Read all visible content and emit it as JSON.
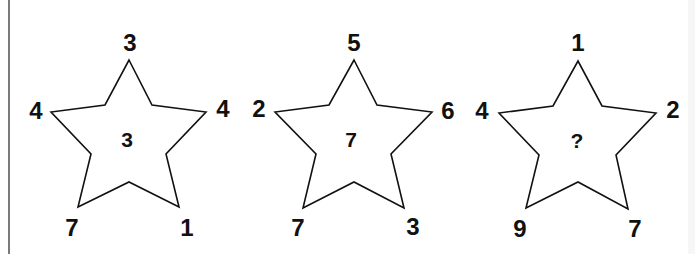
{
  "puzzle": {
    "stars": [
      {
        "top": "3",
        "left": "4",
        "right": "4",
        "bottom_left": "7",
        "bottom_right": "1",
        "center": "3"
      },
      {
        "top": "5",
        "left": "2",
        "right": "6",
        "bottom_left": "7",
        "bottom_right": "3",
        "center": "7"
      },
      {
        "top": "1",
        "left": "4",
        "right": "2",
        "bottom_left": "9",
        "bottom_right": "7",
        "center": "?"
      }
    ]
  },
  "colors": {
    "stroke": "#111111",
    "text": "#111111",
    "border": "#7a7a7a",
    "background": "#ffffff"
  }
}
